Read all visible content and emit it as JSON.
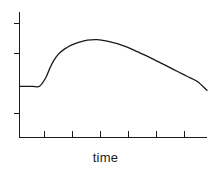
{
  "figure": {
    "background_color": "#ffffff",
    "line_color": "#1a1a1a",
    "xlabel": "time",
    "ylabel": ""
  },
  "chart_data": {
    "type": "line",
    "title": "",
    "xlabel": "time",
    "ylabel": "",
    "grid": false,
    "legend": false,
    "xlim": [
      0,
      188
    ],
    "ylim": [
      0,
      125
    ],
    "x_ticks": [
      25,
      53,
      81,
      109,
      137,
      165
    ],
    "x_tick_labels": [
      "",
      "",
      "",
      "",
      "",
      ""
    ],
    "y_ticks": [
      24,
      84,
      114
    ],
    "y_tick_labels": [
      "",
      "",
      ""
    ],
    "annotations": [],
    "series": [
      {
        "name": "response",
        "description": "flat baseline, step rise to a rounded peak, then slow decay",
        "x": [
          0,
          13,
          20,
          26,
          30,
          34,
          39,
          45,
          52,
          60,
          68,
          78,
          88,
          98,
          108,
          118,
          128,
          138,
          148,
          158,
          168,
          178,
          188
        ],
        "y": [
          51,
          51,
          51,
          59,
          68,
          76,
          83,
          88,
          92,
          95,
          97,
          97.5,
          96,
          93.5,
          90,
          85.5,
          81,
          76,
          71,
          66,
          61,
          56,
          47
        ]
      }
    ]
  }
}
